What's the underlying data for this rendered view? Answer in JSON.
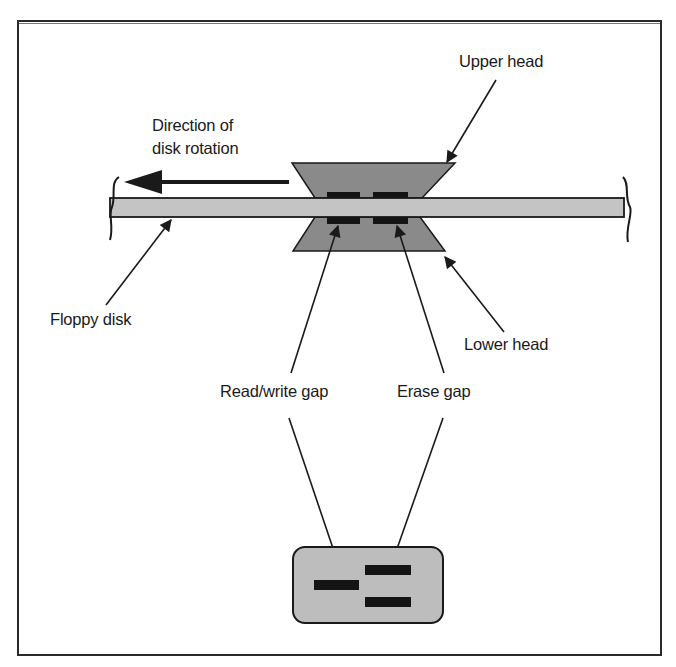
{
  "figure": {
    "type": "diagram"
  },
  "labels": {
    "upper_head": "Upper head",
    "direction_line1": "Direction of",
    "direction_line2": "disk rotation",
    "floppy_disk": "Floppy disk",
    "lower_head": "Lower head",
    "read_write_gap": "Read/write gap",
    "erase_gap": "Erase gap"
  },
  "colors": {
    "frame": "#2a2a2a",
    "head_fill": "#8a8a8a",
    "disk_fill": "#c4c4c4",
    "gap_fill": "#141414",
    "detail_box_fill": "#bdbdbd",
    "line": "#1a1a1a"
  }
}
